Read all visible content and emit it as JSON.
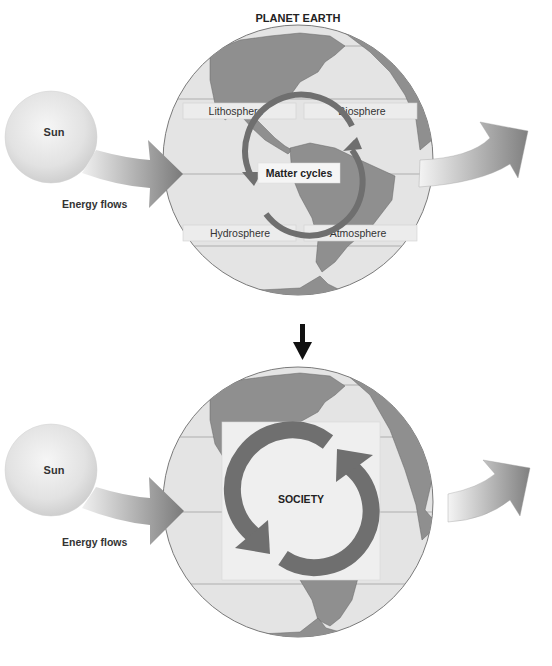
{
  "title": "PLANET EARTH",
  "top_panel": {
    "sun_label": "Sun",
    "energy_label": "Energy flows",
    "spheres": [
      "Lithosphere",
      "Biosphere",
      "Hydrosphere",
      "Atmosphere"
    ],
    "center_label": "Matter cycles"
  },
  "bottom_panel": {
    "sun_label": "Sun",
    "energy_label": "Energy flows",
    "center_label": "SOCIETY"
  },
  "colors": {
    "ocean": "#e4e4e4",
    "land": "#8f8f8f",
    "cycle_arrow": "#6f6f6f",
    "sun": "#e8e8e8",
    "text": "#222222"
  }
}
